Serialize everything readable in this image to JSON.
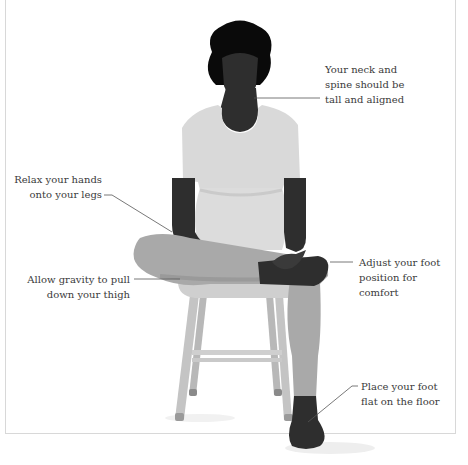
{
  "diagram": {
    "colors": {
      "skin": "#2e2e2e",
      "hair": "#0a0a0a",
      "clothing_top": "#d9d9d9",
      "clothing_leg": "#a9a9a9",
      "stool": "#c4c4c4",
      "leader_line": "#555555",
      "text": "#3a3a3a",
      "border": "#d8d8d8"
    },
    "annotations": [
      {
        "id": "neck-spine",
        "lines": [
          "Your neck and",
          "spine should be",
          "tall and aligned"
        ]
      },
      {
        "id": "hands",
        "lines": [
          "Relax your hands",
          "onto your legs"
        ]
      },
      {
        "id": "thigh",
        "lines": [
          "Allow gravity to pull",
          "down your thigh"
        ]
      },
      {
        "id": "foot-adjust",
        "lines": [
          "Adjust your foot",
          "position for",
          "comfort"
        ]
      },
      {
        "id": "foot-floor",
        "lines": [
          "Place your foot",
          "flat on the floor"
        ]
      }
    ]
  }
}
